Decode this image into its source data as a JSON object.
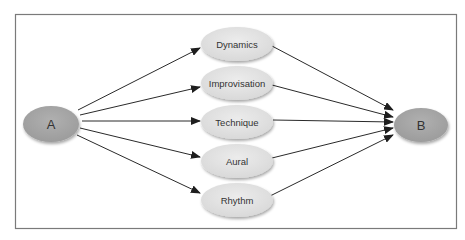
{
  "diagram": {
    "type": "flow",
    "frame_color": "#7a7a7a",
    "edge_color": "#2a2a2a",
    "source": {
      "id": "A",
      "label": "A",
      "fill": "#a9a9a9"
    },
    "target": {
      "id": "B",
      "label": "B",
      "fill": "#a9a9a9"
    },
    "intermediates": [
      {
        "id": "dynamics",
        "label": "Dynamics",
        "fill": "#e3e3e3"
      },
      {
        "id": "improvisation",
        "label": "Improvisation",
        "fill": "#e3e3e3"
      },
      {
        "id": "technique",
        "label": "Technique",
        "fill": "#e3e3e3"
      },
      {
        "id": "aural",
        "label": "Aural",
        "fill": "#e3e3e3"
      },
      {
        "id": "rhythm",
        "label": "Rhythm",
        "fill": "#e3e3e3"
      }
    ],
    "edges": [
      {
        "from": "A",
        "to": "Dynamics"
      },
      {
        "from": "A",
        "to": "Improvisation"
      },
      {
        "from": "A",
        "to": "Technique"
      },
      {
        "from": "A",
        "to": "Aural"
      },
      {
        "from": "A",
        "to": "Rhythm"
      },
      {
        "from": "Dynamics",
        "to": "B"
      },
      {
        "from": "Improvisation",
        "to": "B"
      },
      {
        "from": "Technique",
        "to": "B"
      },
      {
        "from": "Aural",
        "to": "B"
      },
      {
        "from": "Rhythm",
        "to": "B"
      }
    ]
  }
}
